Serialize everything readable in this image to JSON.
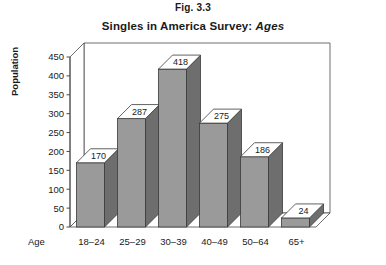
{
  "figure": {
    "caption": "Fig. 3.3",
    "title_main": "Singles in America Survey:",
    "title_emphasis": "Ages"
  },
  "chart_data": {
    "type": "bar",
    "title": "Singles in America Survey: Ages",
    "xlabel": "Age",
    "ylabel": "Population",
    "categories": [
      "18–24",
      "25–29",
      "30–39",
      "40–49",
      "50–64",
      "65+"
    ],
    "values": [
      170,
      287,
      418,
      275,
      186,
      24
    ],
    "value_labels": [
      "170",
      "287",
      "418",
      "275",
      "186",
      "24"
    ],
    "ylim": [
      0,
      450
    ],
    "yticks": [
      0,
      50,
      100,
      150,
      200,
      250,
      300,
      350,
      400,
      450
    ],
    "ytick_labels": [
      "0",
      "50",
      "100",
      "150",
      "200",
      "250",
      "300",
      "350",
      "400",
      "450"
    ],
    "grid": false,
    "legend": null,
    "style": "3d-column",
    "colors": {
      "bar_front": "#9a9a9a",
      "bar_side": "#6e6e6e",
      "bar_top": "#ffffff",
      "axis": "#4a4a4a",
      "background": "#ffffff"
    }
  }
}
